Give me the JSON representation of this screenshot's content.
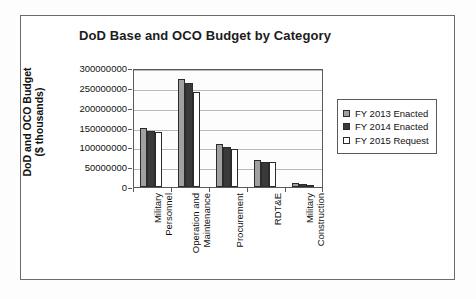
{
  "chart_data": {
    "type": "bar",
    "title": "DoD Base and OCO Budget by Category",
    "xlabel": "",
    "ylabel": "DoD and OCO Budget ($ thousands)",
    "ylabel_line1": "DoD and OCO Budget",
    "ylabel_line2": "($ thousands)",
    "ylim": [
      0,
      300000000
    ],
    "ytick_step": 50000000,
    "ytick_labels": [
      "300000000",
      "250000000",
      "200000000",
      "150000000",
      "100000000",
      "50000000",
      "0"
    ],
    "ytick_values": [
      300000000,
      250000000,
      200000000,
      150000000,
      100000000,
      50000000,
      0
    ],
    "grid": true,
    "legend_position": "right",
    "categories": [
      "Military Personnel",
      "Operation and Maintenance",
      "Procurement",
      "RDT&E",
      "Military Construction"
    ],
    "category_lines": [
      [
        "Military",
        "Personnel"
      ],
      [
        "Operation and",
        "Maintenance"
      ],
      [
        "Procurement"
      ],
      [
        "RDT&E"
      ],
      [
        "Military",
        "Construction"
      ]
    ],
    "series": [
      {
        "name": "FY 2013 Enacted",
        "color": "#a0a0a0",
        "values": [
          148000000,
          272000000,
          109000000,
          69000000,
          9000000
        ]
      },
      {
        "name": "FY 2014 Enacted",
        "color": "#3a3a3a",
        "values": [
          142000000,
          263000000,
          100000000,
          63000000,
          8000000
        ]
      },
      {
        "name": "FY 2015 Request",
        "color": "#ffffff",
        "values": [
          139000000,
          240000000,
          95000000,
          63000000,
          5000000
        ]
      }
    ]
  }
}
